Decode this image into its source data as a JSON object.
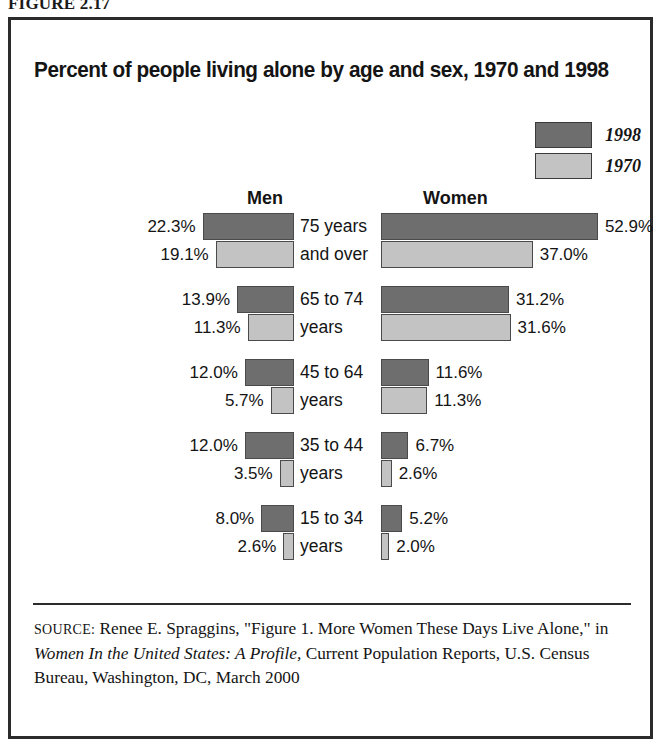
{
  "figure": {
    "label": "FIGURE 2.17"
  },
  "chart": {
    "title": "Percent of people living alone by age and sex, 1970 and 1998",
    "legend": [
      {
        "label": "1998",
        "swatch": "dark",
        "color": "#6e6e6e"
      },
      {
        "label": "1970",
        "swatch": "light",
        "color": "#c3c3c3"
      }
    ],
    "columns": {
      "men": "Men",
      "women": "Women"
    }
  },
  "chart_data": {
    "type": "bar",
    "title": "Percent of people living alone by age and sex, 1970 and 1998",
    "xlabel": "",
    "ylabel": "",
    "orientation": "horizontal-diverging",
    "legend_position": "top-right",
    "grid": false,
    "xlim": [
      0,
      55
    ],
    "unit": "percent",
    "categories": [
      "75 years and over",
      "65 to 74 years",
      "45 to 64 years",
      "35 to 44 years",
      "15 to 34 years"
    ],
    "category_lines": [
      [
        "75 years",
        "and over"
      ],
      [
        "65 to 74",
        "years"
      ],
      [
        "45 to 64",
        "years"
      ],
      [
        "35 to 44",
        "years"
      ],
      [
        "15 to 34",
        "years"
      ]
    ],
    "groups": [
      "Men",
      "Women"
    ],
    "series": [
      {
        "name": "Men 1998",
        "group": "Men",
        "year": "1998",
        "values": [
          22.3,
          13.9,
          12.0,
          12.0,
          8.0
        ]
      },
      {
        "name": "Men 1970",
        "group": "Men",
        "year": "1970",
        "values": [
          19.1,
          11.3,
          5.7,
          3.5,
          2.6
        ]
      },
      {
        "name": "Women 1998",
        "group": "Women",
        "year": "1998",
        "values": [
          52.9,
          31.2,
          11.6,
          6.7,
          5.2
        ]
      },
      {
        "name": "Women 1970",
        "group": "Women",
        "year": "1970",
        "values": [
          37.0,
          31.6,
          11.3,
          2.6,
          2.0
        ]
      }
    ],
    "labels": {
      "men_1998": [
        "22.3%",
        "13.9%",
        "12.0%",
        "12.0%",
        "8.0%"
      ],
      "men_1970": [
        "19.1%",
        "11.3%",
        "5.7%",
        "3.5%",
        "2.6%"
      ],
      "women_1998": [
        "52.9%",
        "31.2%",
        "11.6%",
        "6.7%",
        "5.2%"
      ],
      "women_1970": [
        "37.0%",
        "31.6%",
        "11.3%",
        "2.6%",
        "2.0%"
      ]
    }
  },
  "source": {
    "prefix": "SOURCE:",
    "text_part1": " Renee E. Spraggins, \"Figure 1. More Women These Days Live Alone,\" in ",
    "italic_title": "Women In the United States: A Profile,",
    "text_part2": " Current Population Reports, U.S. Census Bureau, Washington, DC, March 2000"
  }
}
